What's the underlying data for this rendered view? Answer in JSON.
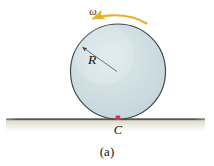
{
  "figure": {
    "caption": "(a)",
    "background_color": "#ffffff",
    "labels": {
      "radius": "R",
      "angular_velocity": "ω",
      "contact_point": "C"
    },
    "colors": {
      "disk_fill": "#cdddE0",
      "disk_fill_light": "#dce9ec",
      "disk_stroke": "#3c4448",
      "arrow": "#e6b12e",
      "contact_dot": "#e0305a",
      "ground_line": "#5c5c57",
      "ground_shade": "#e8e6d8",
      "leader_line": "#5a5f63",
      "text": "#151515"
    },
    "geometry": {
      "circle_center_x": 118,
      "circle_center_y": 71.5,
      "circle_radius": 47.5,
      "ground_y": 119,
      "ground_x_start": 6,
      "ground_x_end": 205,
      "contact_x": 118,
      "contact_y": 119,
      "radius_arrow_tip_x": 81,
      "radius_arrow_tip_y": 46,
      "spin_arrow_start_x": 92,
      "spin_arrow_end_x": 146
    },
    "label_positions": {
      "radius_x": 92,
      "radius_y": 64,
      "omega_x": 89,
      "omega_y": 17,
      "contact_x": 118,
      "contact_y": 135,
      "caption_x": 107,
      "caption_y": 155
    }
  }
}
